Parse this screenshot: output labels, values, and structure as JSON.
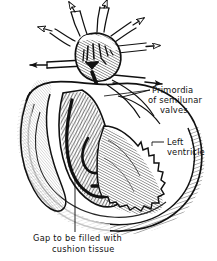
{
  "figure": {
    "type": "anatomical-line-drawing",
    "background_color": "#ffffff",
    "ink_color": "#111111"
  },
  "annotations": {
    "semilunar_valves": {
      "line1": "Primordia",
      "line2": "of semilunar",
      "line3": "valves"
    },
    "left_ventricle": {
      "line1": "Left",
      "line2": "ventricle"
    }
  },
  "caption": {
    "line1": "Gap to be filled with",
    "line2": "cushion tissue"
  },
  "icons": {
    "flow_arrow": "arrow-icon"
  }
}
